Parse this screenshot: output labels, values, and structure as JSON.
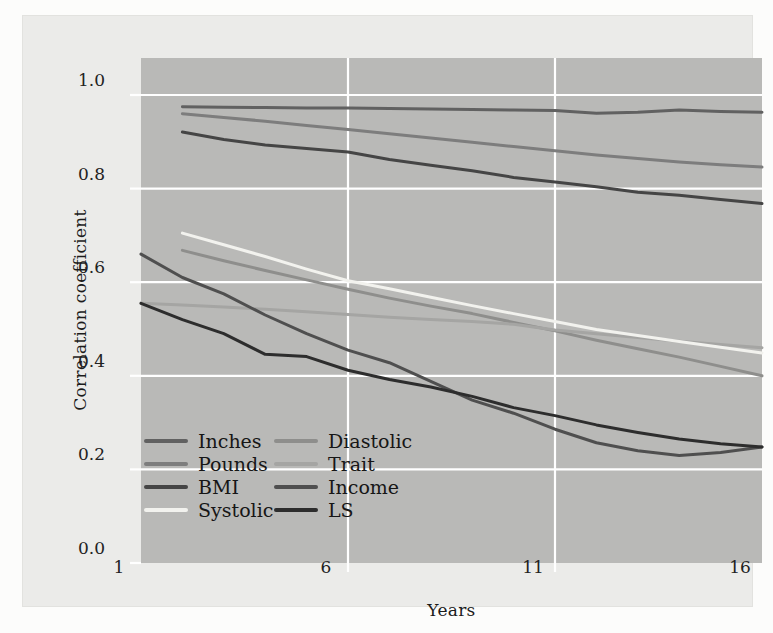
{
  "figure": {
    "colors": {
      "page_bg": "#fcfcfb",
      "panel_bg": "#ebebe9",
      "plot_bg": "#b9b9b7",
      "gridline": "#ffffff"
    }
  },
  "chart_data": {
    "type": "line",
    "title": "",
    "xlabel": "Years",
    "ylabel": "Correlation coefficient",
    "xlim": [
      1,
      16
    ],
    "ylim": [
      0.0,
      1.08
    ],
    "grid": true,
    "legend_position": "inside-lower-left",
    "x_ticks": [
      1,
      6,
      11,
      16
    ],
    "x_tick_labels": [
      "1",
      "6",
      "11",
      "16"
    ],
    "y_ticks": [
      0.0,
      0.2,
      0.4,
      0.6,
      0.8,
      1.0
    ],
    "y_tick_labels": [
      "0.0",
      "0.2",
      "0.4",
      "0.6",
      "0.8",
      "1.0"
    ],
    "years": [
      1,
      2,
      3,
      4,
      5,
      6,
      7,
      8,
      9,
      10,
      11,
      12,
      13,
      14,
      15,
      16
    ],
    "series": [
      {
        "name": "Inches",
        "color": "#616161",
        "start_year": 2,
        "values": [
          0.975,
          0.974,
          0.973,
          0.972,
          0.972,
          0.971,
          0.97,
          0.969,
          0.968,
          0.967,
          0.961,
          0.963,
          0.968,
          0.965,
          0.963
        ]
      },
      {
        "name": "Pounds",
        "color": "#7d7d7d",
        "start_year": 2,
        "values": [
          0.96,
          0.952,
          0.944,
          0.935,
          0.926,
          0.917,
          0.908,
          0.899,
          0.89,
          0.881,
          0.872,
          0.864,
          0.857,
          0.851,
          0.846
        ]
      },
      {
        "name": "BMI",
        "color": "#454545",
        "start_year": 2,
        "values": [
          0.921,
          0.905,
          0.893,
          0.886,
          0.878,
          0.862,
          0.85,
          0.838,
          0.824,
          0.814,
          0.804,
          0.792,
          0.786,
          0.777,
          0.768
        ]
      },
      {
        "name": "Systolic",
        "color": "#f2f2ee",
        "start_year": 2,
        "values": [
          0.705,
          0.68,
          0.655,
          0.628,
          0.603,
          0.586,
          0.568,
          0.55,
          0.533,
          0.516,
          0.499,
          0.486,
          0.473,
          0.461,
          0.449
        ]
      },
      {
        "name": "Diastolic",
        "color": "#8e8e8c",
        "start_year": 2,
        "values": [
          0.668,
          0.646,
          0.625,
          0.605,
          0.585,
          0.566,
          0.549,
          0.533,
          0.514,
          0.496,
          0.476,
          0.458,
          0.44,
          0.42,
          0.4
        ]
      },
      {
        "name": "Trait",
        "color": "#a5a5a3",
        "start_year": 1,
        "values": [
          0.555,
          0.551,
          0.547,
          0.542,
          0.537,
          0.531,
          0.525,
          0.52,
          0.516,
          0.51,
          0.498,
          0.49,
          0.482,
          0.474,
          0.467,
          0.46
        ]
      },
      {
        "name": "Income",
        "color": "#4f4f4f",
        "start_year": 1,
        "values": [
          0.66,
          0.61,
          0.575,
          0.53,
          0.49,
          0.455,
          0.428,
          0.388,
          0.348,
          0.32,
          0.286,
          0.257,
          0.24,
          0.23,
          0.236,
          0.248
        ]
      },
      {
        "name": "LS",
        "color": "#2d2d2d",
        "start_year": 1,
        "values": [
          0.555,
          0.52,
          0.49,
          0.446,
          0.441,
          0.412,
          0.392,
          0.376,
          0.356,
          0.332,
          0.315,
          0.295,
          0.279,
          0.265,
          0.255,
          0.248
        ]
      }
    ],
    "legend_columns": [
      [
        "Inches",
        "Pounds",
        "BMI",
        "Systolic"
      ],
      [
        "Diastolic",
        "Trait",
        "Income",
        "LS"
      ]
    ]
  }
}
